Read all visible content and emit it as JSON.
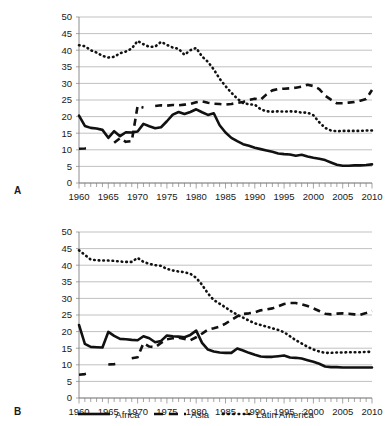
{
  "figure": {
    "panels": [
      {
        "id": "A",
        "label": "A"
      },
      {
        "id": "B",
        "label": "B"
      }
    ],
    "legend": [
      {
        "name": "Africa",
        "style": "solid"
      },
      {
        "name": "Asia",
        "style": "dashed"
      },
      {
        "name": "Latin America",
        "style": "dotted"
      }
    ]
  },
  "chart_data": [
    {
      "panel": "A",
      "type": "line",
      "title": "",
      "xlabel": "",
      "ylabel": "",
      "xlim": [
        1960,
        2010
      ],
      "ylim": [
        0,
        50
      ],
      "yticks": [
        0,
        5,
        10,
        15,
        20,
        25,
        30,
        35,
        40,
        45,
        50
      ],
      "xticks": [
        1960,
        1965,
        1970,
        1975,
        1980,
        1985,
        1990,
        1995,
        2000,
        2005,
        2010
      ],
      "xtick_minor_step": 1,
      "grid": true,
      "legend_position": "bottom",
      "x": [
        1960,
        1961,
        1962,
        1963,
        1964,
        1965,
        1966,
        1967,
        1968,
        1969,
        1970,
        1971,
        1972,
        1973,
        1974,
        1975,
        1976,
        1977,
        1978,
        1979,
        1980,
        1981,
        1982,
        1983,
        1984,
        1985,
        1986,
        1987,
        1988,
        1989,
        1990,
        1991,
        1992,
        1993,
        1994,
        1995,
        1996,
        1997,
        1998,
        1999,
        2000,
        2001,
        2002,
        2003,
        2004,
        2005,
        2006,
        2007,
        2008,
        2009,
        2010
      ],
      "series": [
        {
          "name": "Africa",
          "style": "solid",
          "values": [
            20.3,
            17.2,
            16.6,
            16.4,
            16.0,
            13.6,
            15.6,
            14.1,
            15.3,
            15.2,
            15.5,
            17.8,
            17.1,
            16.5,
            16.8,
            18.6,
            20.6,
            21.4,
            20.8,
            21.4,
            22.2,
            21.3,
            20.5,
            21.0,
            17.4,
            15.2,
            13.6,
            12.6,
            11.7,
            11.2,
            10.6,
            10.2,
            9.8,
            9.4,
            8.9,
            8.7,
            8.6,
            8.2,
            8.5,
            8.0,
            7.6,
            7.3,
            6.9,
            6.2,
            5.5,
            5.2,
            5.2,
            5.3,
            5.3,
            5.4,
            5.6
          ]
        },
        {
          "name": "Asia",
          "style": "dashed",
          "values": [
            10.3,
            10.4,
            10.7,
            null,
            null,
            null,
            12.1,
            13.5,
            12.4,
            12.6,
            23.2,
            22.7,
            null,
            23.2,
            23.4,
            23.3,
            23.5,
            23.4,
            23.6,
            23.8,
            24.3,
            24.6,
            24.2,
            23.9,
            23.8,
            23.6,
            23.8,
            24.1,
            24.4,
            25.0,
            25.4,
            25.1,
            26.7,
            27.9,
            28.3,
            28.4,
            28.5,
            28.7,
            29.0,
            29.6,
            29.2,
            28.3,
            26.3,
            25.1,
            24.0,
            24.0,
            24.2,
            24.4,
            24.8,
            25.3,
            28.0
          ]
        },
        {
          "name": "Latin America",
          "style": "dotted",
          "values": [
            41.5,
            41.2,
            40.0,
            39.3,
            38.3,
            37.8,
            38.0,
            39.1,
            39.6,
            40.5,
            42.8,
            41.8,
            41.0,
            41.1,
            42.5,
            41.6,
            40.8,
            40.4,
            38.6,
            40.0,
            40.7,
            38.1,
            36.5,
            34.2,
            31.4,
            29.2,
            27.2,
            25.4,
            24.1,
            23.7,
            23.6,
            22.2,
            21.6,
            21.5,
            21.6,
            21.5,
            21.6,
            21.5,
            21.2,
            21.2,
            20.4,
            18.3,
            16.6,
            15.8,
            15.6,
            15.7,
            15.7,
            15.7,
            15.7,
            15.8,
            15.8
          ]
        }
      ]
    },
    {
      "panel": "B",
      "type": "line",
      "title": "",
      "xlabel": "",
      "ylabel": "",
      "xlim": [
        1960,
        2010
      ],
      "ylim": [
        0,
        50
      ],
      "yticks": [
        0,
        5,
        10,
        15,
        20,
        25,
        30,
        35,
        40,
        45,
        50
      ],
      "xticks": [
        1960,
        1965,
        1970,
        1975,
        1980,
        1985,
        1990,
        1995,
        2000,
        2005,
        2010
      ],
      "xtick_minor_step": 1,
      "grid": true,
      "legend_position": "bottom",
      "x": [
        1960,
        1961,
        1962,
        1963,
        1964,
        1965,
        1966,
        1967,
        1968,
        1969,
        1970,
        1971,
        1972,
        1973,
        1974,
        1975,
        1976,
        1977,
        1978,
        1979,
        1980,
        1981,
        1982,
        1983,
        1984,
        1985,
        1986,
        1987,
        1988,
        1989,
        1990,
        1991,
        1992,
        1993,
        1994,
        1995,
        1996,
        1997,
        1998,
        1999,
        2000,
        2001,
        2002,
        2003,
        2004,
        2005,
        2006,
        2007,
        2008,
        2009,
        2010
      ],
      "series": [
        {
          "name": "Africa",
          "style": "solid",
          "values": [
            22.0,
            16.3,
            15.4,
            15.3,
            15.2,
            19.9,
            18.7,
            17.8,
            17.7,
            17.5,
            17.4,
            18.6,
            18.0,
            16.8,
            17.2,
            18.8,
            18.6,
            18.5,
            18.3,
            19.0,
            20.3,
            16.6,
            14.6,
            14.0,
            13.7,
            13.6,
            13.6,
            14.9,
            14.3,
            13.6,
            13.0,
            12.5,
            12.4,
            12.4,
            12.6,
            12.8,
            12.2,
            12.1,
            11.9,
            11.4,
            10.9,
            10.3,
            9.5,
            9.3,
            9.3,
            9.2,
            9.2,
            9.2,
            9.2,
            9.2,
            9.2
          ]
        },
        {
          "name": "Asia",
          "style": "dashed",
          "values": [
            7.0,
            7.2,
            7.6,
            null,
            null,
            10.1,
            10.2,
            10.4,
            null,
            12.0,
            12.3,
            16.5,
            15.5,
            15.3,
            16.6,
            17.7,
            18.0,
            18.2,
            17.8,
            17.4,
            18.3,
            19.4,
            20.6,
            21.0,
            21.5,
            22.4,
            23.5,
            24.6,
            25.3,
            25.5,
            25.8,
            26.4,
            26.7,
            27.0,
            27.6,
            28.3,
            28.6,
            28.6,
            28.2,
            27.7,
            27.0,
            26.2,
            25.4,
            25.2,
            25.4,
            25.5,
            25.4,
            25.2,
            25.1,
            25.6,
            26.2
          ]
        },
        {
          "name": "Latin America",
          "style": "dotted",
          "values": [
            44.5,
            43.1,
            41.7,
            41.5,
            41.4,
            41.4,
            41.3,
            41.1,
            41.0,
            41.0,
            42.2,
            41.0,
            40.4,
            40.0,
            39.8,
            38.9,
            38.4,
            38.1,
            37.9,
            37.4,
            36.2,
            34.1,
            31.5,
            29.5,
            28.4,
            27.3,
            26.1,
            25.1,
            24.2,
            23.3,
            22.5,
            22.0,
            21.5,
            21.0,
            20.5,
            19.8,
            18.6,
            17.4,
            16.4,
            15.4,
            14.6,
            14.0,
            13.6,
            13.6,
            13.7,
            13.7,
            13.8,
            13.8,
            13.8,
            13.9,
            13.9
          ]
        }
      ]
    }
  ]
}
